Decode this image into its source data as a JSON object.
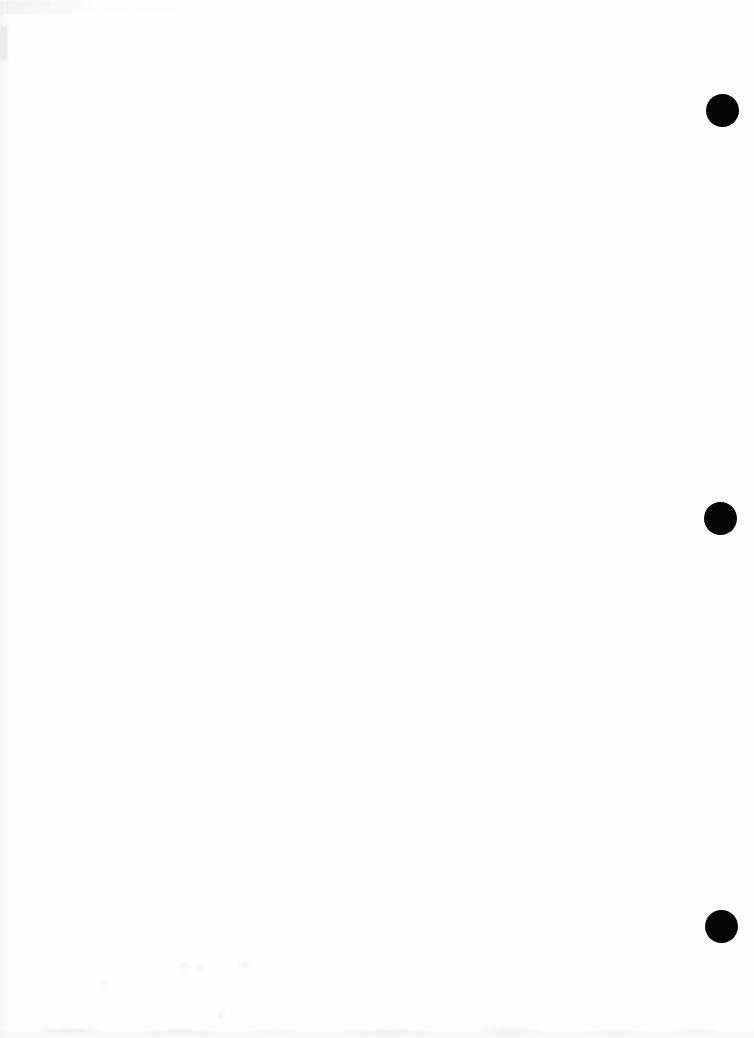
{
  "document": {
    "title": "Scanned Blank Page",
    "page_background_color": "#ffffff",
    "paper_color": "#fefefe",
    "width_px": 754,
    "height_px": 1038,
    "content_text": "",
    "description": "Blank scanned document page with three solid black circular register marks in the right margin"
  },
  "marks": {
    "color": "#050505",
    "shape": "circle",
    "count": 3,
    "items": [
      {
        "id": "register-mark-top",
        "center_x": 722,
        "center_y": 110,
        "diameter": 33
      },
      {
        "id": "register-mark-middle",
        "center_x": 720,
        "center_y": 518,
        "diameter": 33
      },
      {
        "id": "register-mark-bottom",
        "center_x": 721,
        "center_y": 926,
        "diameter": 33
      }
    ]
  },
  "scan_artifacts": {
    "color": "#e7e9ec",
    "items": [
      {
        "id": "top-edge-smudge",
        "x": 0,
        "y": 0,
        "width": 300,
        "height": 14
      },
      {
        "id": "left-edge-band",
        "x": 0,
        "y": 0,
        "width": 9,
        "height": 1038
      },
      {
        "id": "left-edge-blotch",
        "x": 0,
        "y": 26,
        "width": 7,
        "height": 34
      },
      {
        "id": "bottom-edge-band",
        "x": 0,
        "y": 1021,
        "width": 754,
        "height": 17
      },
      {
        "id": "bottom-edge-speckle",
        "x": 40,
        "y": 1027,
        "width": 690,
        "height": 9
      },
      {
        "id": "faint-spot-a",
        "x": 180,
        "y": 963,
        "width": 7,
        "height": 6
      },
      {
        "id": "faint-spot-b",
        "x": 197,
        "y": 965,
        "width": 6,
        "height": 6
      },
      {
        "id": "faint-spot-c",
        "x": 240,
        "y": 962,
        "width": 9,
        "height": 6
      },
      {
        "id": "faint-spot-d",
        "x": 101,
        "y": 980,
        "width": 6,
        "height": 6
      },
      {
        "id": "faint-spot-e",
        "x": 218,
        "y": 1013,
        "width": 6,
        "height": 5
      }
    ]
  }
}
